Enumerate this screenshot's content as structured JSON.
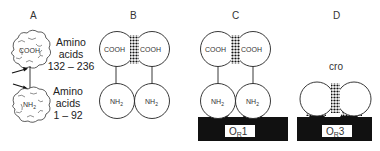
{
  "figure": {
    "panels": [
      {
        "id": "A",
        "label": "A",
        "domains": [
          {
            "name": "COOH",
            "text": "COOH",
            "description_lines": [
              "Amino",
              "acids",
              "132 – 236"
            ]
          },
          {
            "name": "NH2",
            "text": "NH",
            "sub": "2",
            "description_lines": [
              "Amino",
              "acids",
              "1 – 92"
            ]
          }
        ],
        "arrows": 2
      },
      {
        "id": "B",
        "label": "B",
        "top": [
          "COOH",
          "COOH"
        ],
        "bottom_text": "NH",
        "bottom_sub": "2"
      },
      {
        "id": "C",
        "label": "C",
        "top": [
          "COOH",
          "COOH"
        ],
        "bottom_text": "NH",
        "bottom_sub": "2",
        "operator_text": "O",
        "operator_sub": "R",
        "operator_num": "1"
      },
      {
        "id": "D",
        "label": "D",
        "protein": "cro",
        "operator_text": "O",
        "operator_sub": "R",
        "operator_num": "3"
      }
    ]
  },
  "colors": {
    "line": "#222222",
    "dna": "#111111",
    "fill": "#ffffff"
  }
}
